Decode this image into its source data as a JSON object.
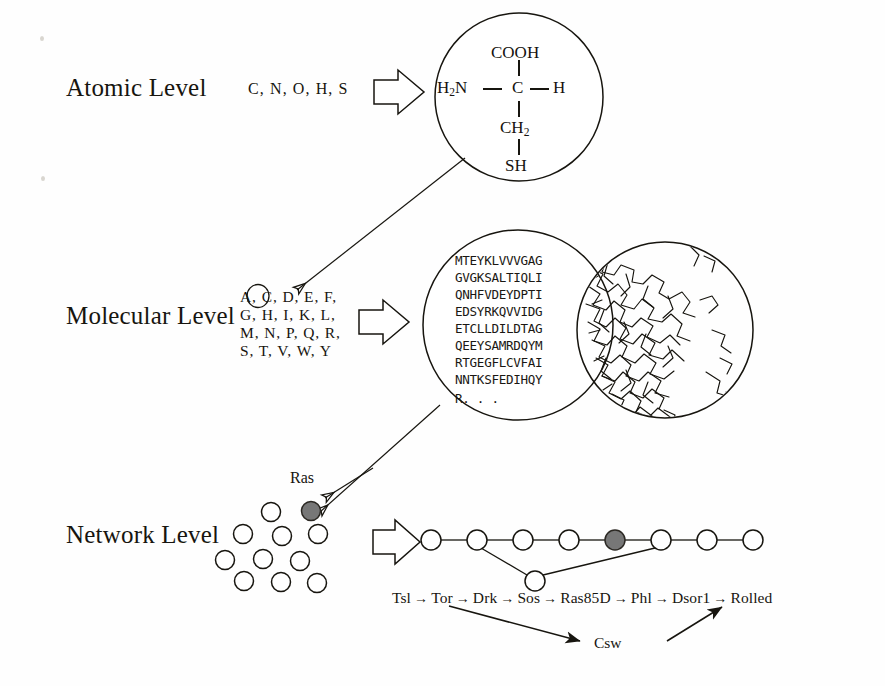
{
  "figure": {
    "ink_color": "#17150f",
    "node_fill_highlight": "#777777"
  },
  "levels": [
    {
      "id": "atomic",
      "label": "Atomic Level"
    },
    {
      "id": "molecular",
      "label": "Molecular Level"
    },
    {
      "id": "network",
      "label": "Network Level"
    }
  ],
  "atomic": {
    "elements_label": "C, N, O, H, S",
    "molecule_name": "cysteine",
    "structure": {
      "top": "COOH",
      "left": "H2N",
      "center": "C",
      "right": "H",
      "below_center": "CH2",
      "bottom": "SH"
    }
  },
  "molecular": {
    "amino_acid_lines": [
      "A, C, D, E, F,",
      "G, H, I, K, L,",
      "M, N, P, Q, R,",
      "S, T, V, W, Y"
    ],
    "circled_residue": "C",
    "sequence_lines": [
      "MTEYKLVVVGAG",
      "GVGKSALTIQLI",
      "QNHFVDEYDPTI",
      "EDSYRKQVVIDG",
      "ETCLLDILDTAG",
      "QEEYSAMRDQYM",
      "RTGEGFLCVFAI",
      "NNTKSFEDIHQY",
      "R. . ."
    ],
    "structure_caption": "protein 3D wireframe structure"
  },
  "network": {
    "highlight_node_label": "Ras",
    "scatter_node_count": 11,
    "chain_node_count": 8,
    "highlighted_chain_index": 5,
    "pathway_main": [
      "Tsl",
      "Tor",
      "Drk",
      "Sos",
      "Ras85D",
      "Phl",
      "Dsor1",
      "Rolled"
    ],
    "pathway_arrow": "→",
    "pathway_branch_node": "Csw",
    "branch_from": "Tor",
    "branch_to": "Phl"
  }
}
